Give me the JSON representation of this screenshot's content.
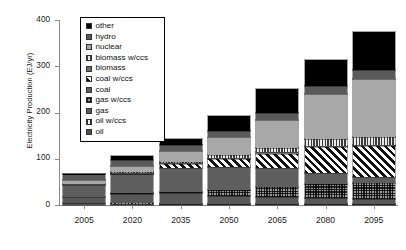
{
  "chart_data": {
    "type": "bar",
    "stacked": true,
    "title": "",
    "xlabel": "",
    "ylabel": "Electricity Production (EJ/yr)",
    "categories": [
      "2005",
      "2020",
      "2035",
      "2050",
      "2065",
      "2080",
      "2095"
    ],
    "ylim": [
      0,
      400
    ],
    "yticks": [
      0,
      100,
      200,
      300,
      400
    ],
    "ytick_labels": [
      "0",
      "100",
      "200",
      "300",
      "400"
    ],
    "grid": false,
    "legend_position": "top-left-inside",
    "series": [
      {
        "name": "oil",
        "color": "#4f4f4f",
        "pattern": "solid",
        "values": [
          4,
          3,
          2,
          2,
          2,
          2,
          2
        ]
      },
      {
        "name": "oil w/ccs",
        "color": "#2f2f2f",
        "pattern": "fine-vertical",
        "values": [
          0,
          1,
          1,
          1,
          1,
          1,
          1
        ]
      },
      {
        "name": "gas",
        "color": "#585858",
        "pattern": "solid",
        "values": [
          13,
          20,
          22,
          16,
          14,
          12,
          10
        ]
      },
      {
        "name": "gas w/ccs",
        "color": "#2a2a2a",
        "pattern": "cross-hatch",
        "values": [
          0,
          2,
          4,
          14,
          22,
          30,
          34
        ]
      },
      {
        "name": "coal",
        "color": "#5e5e5e",
        "pattern": "solid",
        "values": [
          27,
          41,
          52,
          50,
          40,
          24,
          14
        ]
      },
      {
        "name": "coal w/ccs",
        "color": "#111111",
        "pattern": "diagonal-hatch",
        "values": [
          0,
          1,
          7,
          16,
          32,
          56,
          66
        ]
      },
      {
        "name": "biomass",
        "color": "#6e6e6e",
        "pattern": "solid",
        "values": [
          1,
          2,
          3,
          3,
          3,
          3,
          3
        ]
      },
      {
        "name": "biomass w/ccs",
        "color": "#3c3c3c",
        "pattern": "vertical-hatch",
        "values": [
          0,
          1,
          3,
          6,
          10,
          14,
          16
        ]
      },
      {
        "name": "nuclear",
        "color": "#a8a8a8",
        "pattern": "solid",
        "values": [
          10,
          14,
          22,
          38,
          60,
          98,
          127
        ]
      },
      {
        "name": "hydro",
        "color": "#5a5a5a",
        "pattern": "solid",
        "values": [
          11,
          13,
          14,
          15,
          16,
          17,
          18
        ]
      },
      {
        "name": "other",
        "color": "#000000",
        "pattern": "solid",
        "values": [
          2,
          7,
          13,
          32,
          50,
          56,
          84
        ]
      }
    ],
    "totals": [
      68,
      105,
      143,
      193,
      250,
      313,
      375
    ]
  },
  "legend": {
    "items": [
      {
        "label": "other"
      },
      {
        "label": "hydro"
      },
      {
        "label": "nuclear"
      },
      {
        "label": "biomass w/ccs"
      },
      {
        "label": "biomass"
      },
      {
        "label": "coal w/ccs"
      },
      {
        "label": "coal"
      },
      {
        "label": "gas w/ccs"
      },
      {
        "label": "gas"
      },
      {
        "label": "oil w/ccs"
      },
      {
        "label": "oil"
      }
    ]
  }
}
